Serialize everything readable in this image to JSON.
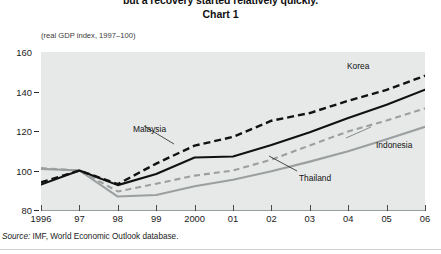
{
  "header": {
    "headline": "but a recovery started relatively quickly.",
    "chart_number": "Chart 1"
  },
  "axis_note": "(real GDP index, 1997–100)",
  "source": {
    "label": "Source:",
    "text": "IMF, World Economic Outlook database."
  },
  "colors": {
    "plot_background": "#e7e9e9",
    "page_background": "#ffffff",
    "dark_series": "#111111",
    "light_series": "#9b9fa0",
    "axis": "#2a2a2a"
  },
  "chart_data": {
    "type": "line",
    "title": "Chart 1",
    "subtitle": "but a recovery started relatively quickly.",
    "xlabel": "",
    "ylabel": "(real GDP index, 1997–100)",
    "ylim": [
      80,
      160
    ],
    "xlim": [
      1996,
      2006
    ],
    "yticks": [
      80,
      100,
      120,
      140,
      160
    ],
    "ytick_labels": [
      "80",
      "100",
      "120",
      "140",
      "160"
    ],
    "x": [
      1996,
      1997,
      1998,
      1999,
      2000,
      2001,
      2002,
      2003,
      2004,
      2005,
      2006
    ],
    "xtick_labels": [
      "1996",
      "97",
      "98",
      "99",
      "2000",
      "01",
      "02",
      "03",
      "04",
      "05",
      "06"
    ],
    "grid": false,
    "legend": "inline-annotations",
    "series": [
      {
        "name": "Korea",
        "style": "dashed",
        "color": "#111111",
        "values": [
          94.0,
          100.0,
          93.1,
          103.5,
          112.6,
          117.0,
          125.2,
          129.1,
          135.3,
          140.8,
          148.0
        ]
      },
      {
        "name": "Malaysia",
        "style": "solid",
        "color": "#111111",
        "values": [
          92.9,
          100.0,
          92.6,
          98.2,
          106.6,
          107.1,
          112.9,
          119.4,
          126.6,
          133.3,
          140.9
        ]
      },
      {
        "name": "Thailand",
        "style": "dashed",
        "color": "#9b9fa0",
        "values": [
          101.2,
          100.0,
          89.4,
          93.3,
          97.4,
          100.0,
          105.5,
          112.7,
          119.8,
          125.3,
          131.5
        ]
      },
      {
        "name": "Indonesia",
        "style": "solid",
        "color": "#9b9fa0",
        "values": [
          100.8,
          100.0,
          86.8,
          87.6,
          92.0,
          95.3,
          99.6,
          104.5,
          109.7,
          115.8,
          122.1
        ]
      }
    ],
    "annotations": [
      {
        "text": "Korea",
        "series": "Korea"
      },
      {
        "text": "Malaysia",
        "series": "Malaysia"
      },
      {
        "text": "Thailand",
        "series": "Thailand"
      },
      {
        "text": "Indonesia",
        "series": "Indonesia"
      }
    ]
  }
}
